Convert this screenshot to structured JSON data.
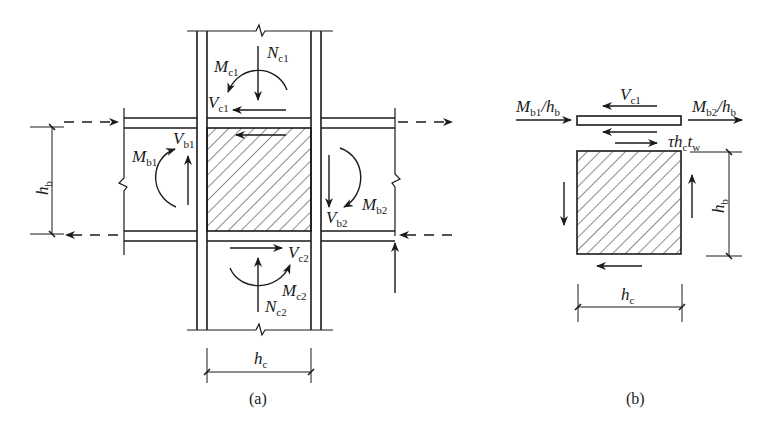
{
  "figure": {
    "panel_a": {
      "caption": "(a)",
      "labels": {
        "Nc1": {
          "main": "N",
          "sub": "c1"
        },
        "Mc1": {
          "main": "M",
          "sub": "c1"
        },
        "Vc1": {
          "main": "V",
          "sub": "c1"
        },
        "Mb1": {
          "main": "M",
          "sub": "b1"
        },
        "Vb1": {
          "main": "V",
          "sub": "b1"
        },
        "Mb2": {
          "main": "M",
          "sub": "b2"
        },
        "Vb2": {
          "main": "V",
          "sub": "b2"
        },
        "Vc2": {
          "main": "V",
          "sub": "c2"
        },
        "Mc2": {
          "main": "M",
          "sub": "c2"
        },
        "Nc2": {
          "main": "N",
          "sub": "c2"
        },
        "hb": {
          "main": "h",
          "sub": "b"
        },
        "hc": {
          "main": "h",
          "sub": "c"
        }
      }
    },
    "panel_b": {
      "caption": "(b)",
      "labels": {
        "Vc1": {
          "main": "V",
          "sub": "c1"
        },
        "Mb1_hb": {
          "main": "M",
          "sub": "b1",
          "rest": "/h",
          "rest_sub": "b"
        },
        "Mb2_hb": {
          "main": "M",
          "sub": "b2",
          "rest": "/h",
          "rest_sub": "b"
        },
        "tau": {
          "text": "τh",
          "sub": "c",
          "rest": "t",
          "rest_sub": "w"
        },
        "hb": {
          "main": "h",
          "sub": "b"
        },
        "hc": {
          "main": "h",
          "sub": "c"
        }
      }
    }
  }
}
